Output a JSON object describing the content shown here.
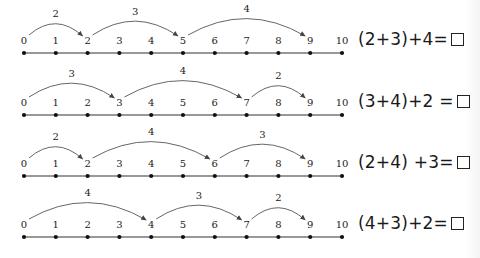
{
  "number_lines": [
    {
      "id": "line-1",
      "ticks": [
        "0",
        "1",
        "2",
        "3",
        "4",
        "5",
        "6",
        "7",
        "8",
        "9",
        "10"
      ],
      "jumps": [
        {
          "from": 0,
          "to": 2,
          "label": "2"
        },
        {
          "from": 2,
          "to": 5,
          "label": "3"
        },
        {
          "from": 5,
          "to": 9,
          "label": "4"
        }
      ],
      "equation": {
        "text": "(2+3)+4=",
        "answer_box": "□"
      }
    },
    {
      "id": "line-2",
      "ticks": [
        "0",
        "1",
        "2",
        "3",
        "4",
        "5",
        "6",
        "7",
        "8",
        "9",
        "10"
      ],
      "jumps": [
        {
          "from": 0,
          "to": 3,
          "label": "3"
        },
        {
          "from": 3,
          "to": 7,
          "label": "4"
        },
        {
          "from": 7,
          "to": 9,
          "label": "2"
        }
      ],
      "equation": {
        "text": "(3+4)+2 =",
        "answer_box": "□"
      }
    },
    {
      "id": "line-3",
      "ticks": [
        "0",
        "1",
        "2",
        "3",
        "4",
        "5",
        "6",
        "7",
        "8",
        "9",
        "10"
      ],
      "jumps": [
        {
          "from": 0,
          "to": 2,
          "label": "2"
        },
        {
          "from": 2,
          "to": 6,
          "label": "4"
        },
        {
          "from": 6,
          "to": 9,
          "label": "3"
        }
      ],
      "equation": {
        "text": "(2+4) +3=",
        "answer_box": "□"
      }
    },
    {
      "id": "line-4",
      "ticks": [
        "0",
        "1",
        "2",
        "3",
        "4",
        "5",
        "6",
        "7",
        "8",
        "9",
        "10"
      ],
      "jumps": [
        {
          "from": 0,
          "to": 4,
          "label": "4"
        },
        {
          "from": 4,
          "to": 7,
          "label": "3"
        },
        {
          "from": 7,
          "to": 9,
          "label": "2"
        }
      ],
      "equation": {
        "text": "(4+3)+2=",
        "answer_box": "□"
      }
    }
  ],
  "colors": {
    "line": "#333333",
    "arc": "#555555",
    "text": "#222222"
  }
}
